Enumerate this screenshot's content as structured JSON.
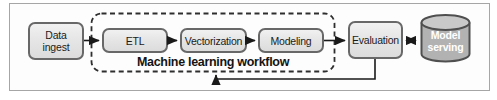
{
  "figure": {
    "group_label": "Machine learning workflow",
    "nodes": {
      "data_ingest": {
        "line1": "Data",
        "line2": "ingest"
      },
      "etl": {
        "label": "ETL"
      },
      "vectorization": {
        "label": "Vectorization"
      },
      "modeling": {
        "label": "Modeling"
      },
      "evaluation": {
        "label": "Evaluation"
      },
      "model_serving": {
        "line1": "Model",
        "line2": "serving"
      }
    },
    "edges": [
      {
        "from": "Data ingest",
        "to": "ETL",
        "style": "arrow"
      },
      {
        "from": "ETL",
        "to": "Vectorization",
        "style": "arrow"
      },
      {
        "from": "Vectorization",
        "to": "Modeling",
        "style": "arrow"
      },
      {
        "from": "Modeling",
        "to": "Evaluation",
        "style": "arrow"
      },
      {
        "from": "Evaluation",
        "to": "Model serving",
        "style": "double-arrow"
      },
      {
        "from": "Evaluation",
        "to": "Machine learning workflow",
        "style": "feedback-arrow"
      }
    ],
    "colors": {
      "box_fill": "#e8e8e8",
      "box_border": "#686868",
      "dashed_border": "#2e2e2e",
      "cylinder_fill": "#b2b2b2",
      "cylinder_top_fill": "#c9c9c9",
      "cylinder_border": "#4f4f4f",
      "frame_border": "#a6a6a6",
      "arrow": "#1a1a1a",
      "text": "#1b1b1b",
      "cylinder_text": "#ffffff"
    }
  }
}
